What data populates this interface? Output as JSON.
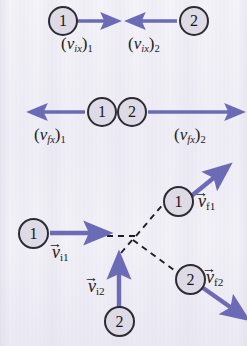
{
  "figure": {
    "background_color": "#efedf5",
    "arrow_color": "#6a6ab6",
    "dashed_line_color": "#1c1c22",
    "disc_fill_color": "#dedbe6",
    "disc_stroke_color": "#2a2a30",
    "label_color": "#1a1a20"
  },
  "panels": {
    "initial_x": {
      "name": "initial x-velocities",
      "ball1": {
        "disc_label": "1",
        "vector_label_prefix": "(",
        "vector_label_v": "v",
        "vector_label_sub": "ix",
        "vector_label_close": ")",
        "vector_label_index": "1",
        "direction": "right"
      },
      "ball2": {
        "disc_label": "2",
        "vector_label_prefix": "(",
        "vector_label_v": "v",
        "vector_label_sub": "ix",
        "vector_label_close": ")",
        "vector_label_index": "2",
        "direction": "left"
      }
    },
    "final_x": {
      "name": "final x-velocities",
      "ball1": {
        "disc_label": "1",
        "vector_label_prefix": "(",
        "vector_label_v": "v",
        "vector_label_sub": "fx",
        "vector_label_close": ")",
        "vector_label_index": "1",
        "direction": "left"
      },
      "ball2": {
        "disc_label": "2",
        "vector_label_prefix": "(",
        "vector_label_v": "v",
        "vector_label_sub": "fx",
        "vector_label_close": ")",
        "vector_label_index": "2",
        "direction": "right"
      }
    },
    "collision_2d": {
      "name": "two-dimensional collision",
      "incoming_ball1": {
        "disc_label": "1",
        "vector_label_v": "v",
        "vector_label_sub": "i1",
        "vector_arrow": "→",
        "direction": "right"
      },
      "incoming_ball2": {
        "disc_label": "2",
        "vector_label_v": "v",
        "vector_label_sub": "i2",
        "vector_arrow": "→",
        "direction": "up"
      },
      "outgoing_ball1": {
        "disc_label": "1",
        "vector_label_v": "v",
        "vector_label_sub": "f1",
        "vector_arrow": "→",
        "direction": "up-right"
      },
      "outgoing_ball2": {
        "disc_label": "2",
        "vector_label_v": "v",
        "vector_label_sub": "f2",
        "vector_arrow": "→",
        "direction": "down-right"
      }
    }
  }
}
